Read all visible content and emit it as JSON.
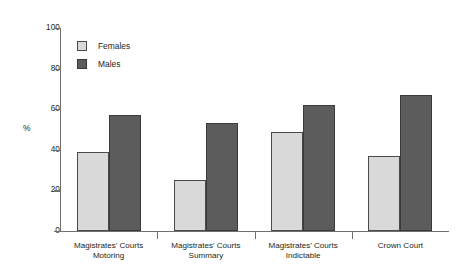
{
  "chart_data": {
    "type": "bar",
    "title": "",
    "subtitle": "",
    "xlabel": "",
    "ylabel": "%",
    "ylim": [
      0,
      100
    ],
    "yticks": [
      0,
      20,
      40,
      60,
      80,
      100
    ],
    "grid": false,
    "legend_position": "top-left",
    "categories": [
      "Magistrates' Courts Motoring",
      "Magistrates' Courts Summary",
      "Magistrates' Courts Indictable",
      "Crown Court"
    ],
    "category_lines": [
      {
        "line1": "Magistrates' Courts",
        "line2": "Motoring"
      },
      {
        "line1": "Magistrates' Courts",
        "line2": "Summary"
      },
      {
        "line1": "Magistrates' Courts",
        "line2": "Indictable"
      },
      {
        "line1": "Crown Court",
        "line2": ""
      }
    ],
    "series": [
      {
        "name": "Females",
        "color": "#d9d9d9",
        "values": [
          39,
          25,
          49,
          37
        ]
      },
      {
        "name": "Males",
        "color": "#5c5c5c",
        "values": [
          57,
          53,
          62,
          67
        ]
      }
    ]
  },
  "legend": {
    "items": [
      {
        "label": "Females"
      },
      {
        "label": "Males"
      }
    ]
  },
  "axis": {
    "y_title": "%",
    "y_tick_labels": [
      "100",
      "80",
      "60",
      "40",
      "20",
      "0"
    ]
  }
}
